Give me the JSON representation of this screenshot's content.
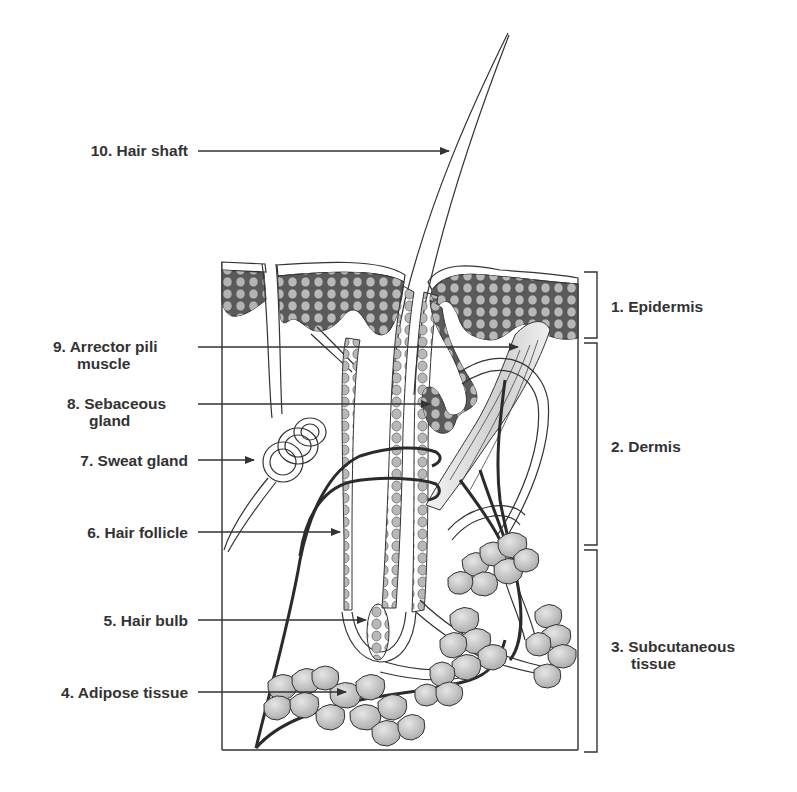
{
  "diagram": {
    "type": "anatomy cross-section",
    "colors": {
      "outline": "#333333",
      "epidermis_fill": "#5a5a5a",
      "cell_fill": "#b5b5b5",
      "adipose_fill": "#c8c8c8",
      "label_text": "#333333"
    }
  },
  "left_labels": [
    {
      "id": "hair-shaft",
      "number": "10.",
      "line1": "10. Hair shaft",
      "line2": ""
    },
    {
      "id": "arrector-pili-muscle",
      "number": "9.",
      "line1": "9. Arrector pili",
      "line2": "muscle"
    },
    {
      "id": "sebaceous-gland",
      "number": "8.",
      "line1": "8. Sebaceous",
      "line2": "gland"
    },
    {
      "id": "sweat-gland",
      "number": "7.",
      "line1": "7. Sweat gland",
      "line2": ""
    },
    {
      "id": "hair-follicle",
      "number": "6.",
      "line1": "6. Hair follicle",
      "line2": ""
    },
    {
      "id": "hair-bulb",
      "number": "5.",
      "line1": "5. Hair bulb",
      "line2": ""
    },
    {
      "id": "adipose-tissue",
      "number": "4.",
      "line1": "4. Adipose tissue",
      "line2": ""
    }
  ],
  "right_labels": [
    {
      "id": "epidermis",
      "number": "1.",
      "line1": "1. Epidermis",
      "line2": ""
    },
    {
      "id": "dermis",
      "number": "2.",
      "line1": "2. Dermis",
      "line2": ""
    },
    {
      "id": "subcutaneous-tissue",
      "number": "3.",
      "line1": "3. Subcutaneous",
      "line2": "tissue"
    }
  ]
}
